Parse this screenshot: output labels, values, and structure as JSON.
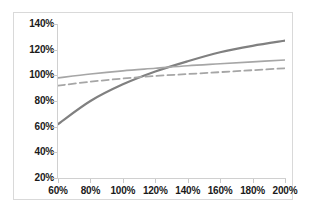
{
  "chart_data": {
    "type": "line",
    "title": "",
    "subtitle": "",
    "xlabel": "",
    "ylabel": "",
    "xlim": [
      60,
      200
    ],
    "ylim": [
      20,
      140
    ],
    "grid": false,
    "legend": "none",
    "x_tick_labels": [
      "60%",
      "80%",
      "100%",
      "120%",
      "140%",
      "160%",
      "180%",
      "200%"
    ],
    "x_ticks": [
      60,
      80,
      100,
      120,
      140,
      160,
      180,
      200
    ],
    "y_tick_labels": [
      "140%",
      "120%",
      "100%",
      "80%",
      "60%",
      "40%",
      "20%"
    ],
    "y_ticks": [
      140,
      120,
      100,
      80,
      60,
      40,
      20
    ],
    "x": [
      60,
      80,
      100,
      120,
      140,
      160,
      180,
      200
    ],
    "series": [
      {
        "name": "series-1",
        "style": "solid",
        "color": "#808080",
        "width": 2.2,
        "values": [
          62,
          80,
          93,
          103,
          111,
          118,
          123,
          127
        ]
      },
      {
        "name": "series-2",
        "style": "solid",
        "color": "#a6a6a6",
        "width": 1.6,
        "values": [
          98,
          101,
          103.5,
          105.5,
          107.5,
          109,
          110.5,
          112
        ]
      },
      {
        "name": "series-3",
        "style": "dashed",
        "color": "#a6a6a6",
        "width": 1.8,
        "values": [
          92,
          95,
          97.5,
          99.5,
          101,
          102.5,
          104,
          105.5
        ]
      }
    ]
  },
  "colors": {
    "frame_border": "#d9d9d9",
    "axis": "#d0d0d0",
    "tick_text": "#1a1a1a",
    "background": "#ffffff"
  }
}
